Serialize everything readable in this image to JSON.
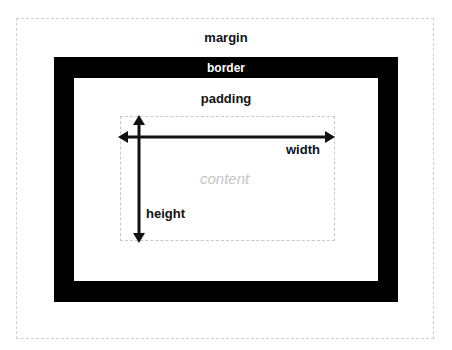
{
  "diagram": {
    "labels": {
      "margin": "margin",
      "border": "border",
      "padding": "padding",
      "content": "content",
      "width": "width",
      "height": "height"
    },
    "colors": {
      "border_fill": "#000000",
      "background": "#ffffff",
      "dashed_outline": "#cfcfcf",
      "content_text": "#c4c4c4",
      "label_text": "#111111",
      "arrow": "#111111"
    }
  }
}
